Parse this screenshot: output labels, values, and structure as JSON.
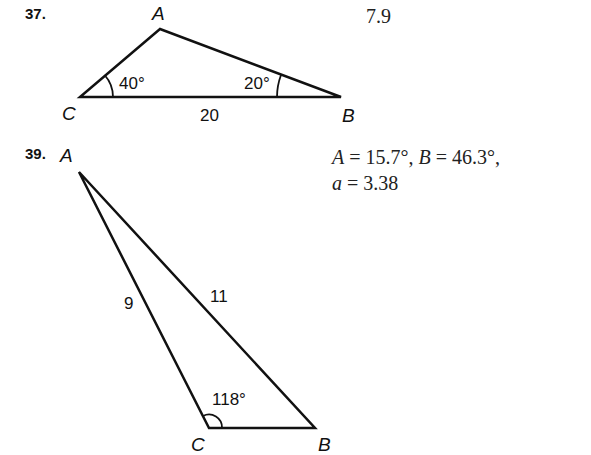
{
  "problems": [
    {
      "number": "37.",
      "answer": "7.9",
      "triangle": {
        "vertices": {
          "A": "A",
          "B": "B",
          "C": "C"
        },
        "angle_C": "40°",
        "angle_B": "20°",
        "side_CB": "20"
      }
    },
    {
      "number": "39.",
      "answer_line1": {
        "A_var": "A",
        "A_val": " = 15.7°, ",
        "B_var": "B",
        "B_val": " = 46.3°,"
      },
      "answer_line2": {
        "a_var": "a",
        "a_val": " = 3.38"
      },
      "triangle": {
        "vertices": {
          "A": "A",
          "B": "B",
          "C": "C"
        },
        "angle_C": "118°",
        "side_AC": "9",
        "side_AB": "11"
      }
    }
  ]
}
